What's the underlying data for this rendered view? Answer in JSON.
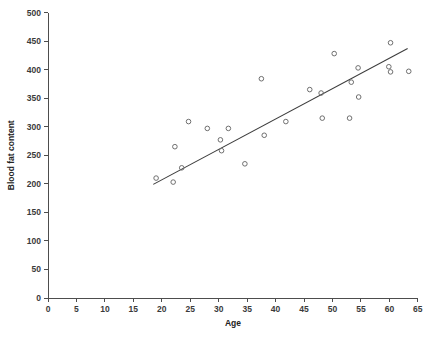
{
  "chart_data": {
    "type": "scatter",
    "title": "",
    "xlabel": "Age",
    "ylabel": "Blood fat content",
    "xlim": [
      0,
      65
    ],
    "ylim": [
      0,
      500
    ],
    "xticks": [
      0,
      5,
      10,
      15,
      20,
      25,
      30,
      35,
      40,
      45,
      50,
      55,
      60,
      65
    ],
    "yticks": [
      0,
      50,
      100,
      150,
      200,
      250,
      300,
      350,
      400,
      450,
      500
    ],
    "grid": false,
    "legend": null,
    "marker": "open-circle",
    "marker_color": "#6f6f6f",
    "line_color": "#3c3c3c",
    "points": [
      {
        "x": 19.0,
        "y": 210
      },
      {
        "x": 22.0,
        "y": 203
      },
      {
        "x": 22.3,
        "y": 265
      },
      {
        "x": 23.5,
        "y": 228
      },
      {
        "x": 24.7,
        "y": 309
      },
      {
        "x": 28.0,
        "y": 297
      },
      {
        "x": 30.3,
        "y": 277
      },
      {
        "x": 30.5,
        "y": 258
      },
      {
        "x": 31.7,
        "y": 297
      },
      {
        "x": 34.6,
        "y": 235
      },
      {
        "x": 37.5,
        "y": 384
      },
      {
        "x": 38.0,
        "y": 285
      },
      {
        "x": 41.8,
        "y": 309
      },
      {
        "x": 46.0,
        "y": 365
      },
      {
        "x": 48.0,
        "y": 359
      },
      {
        "x": 48.2,
        "y": 315
      },
      {
        "x": 50.3,
        "y": 428
      },
      {
        "x": 53.0,
        "y": 315
      },
      {
        "x": 53.3,
        "y": 378
      },
      {
        "x": 54.5,
        "y": 403
      },
      {
        "x": 54.6,
        "y": 352
      },
      {
        "x": 59.9,
        "y": 405
      },
      {
        "x": 60.2,
        "y": 396
      },
      {
        "x": 60.2,
        "y": 447
      },
      {
        "x": 63.4,
        "y": 397
      }
    ],
    "fit_line": {
      "x_start": 18.5,
      "y_start": 199,
      "x_end": 63.2,
      "y_end": 437
    }
  }
}
